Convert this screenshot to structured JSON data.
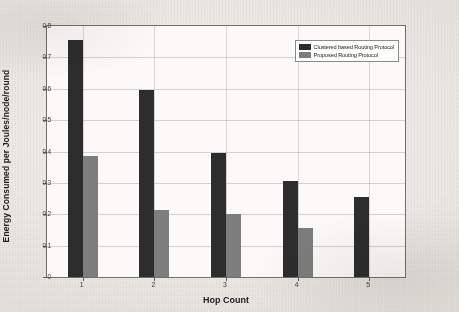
{
  "chart_data": {
    "type": "bar",
    "title": "",
    "xlabel": "Hop Count",
    "ylabel": "Energy Consumed per Joules/node/round",
    "categories": [
      "1",
      "2",
      "3",
      "4",
      "5"
    ],
    "series": [
      {
        "name": "Clustered based Routing Protocol",
        "color": "#2d2d2d",
        "values": [
          0.755,
          0.595,
          0.395,
          0.305,
          0.255
        ]
      },
      {
        "name": "Proposed Routing Protocol",
        "color": "#7d7d7d",
        "values": [
          0.385,
          0.215,
          0.2,
          0.155,
          0
        ]
      }
    ],
    "ylim": [
      0,
      0.8
    ],
    "ytick_labels": [
      "0",
      "0.1",
      "0.2",
      "0.3",
      "0.4",
      "0.5",
      "0.6",
      "0.7",
      "0.8"
    ],
    "ytick_values": [
      0,
      0.1,
      0.2,
      0.3,
      0.4,
      0.5,
      0.6,
      0.7,
      0.8
    ],
    "grid": true,
    "legend_position": "top-right"
  }
}
